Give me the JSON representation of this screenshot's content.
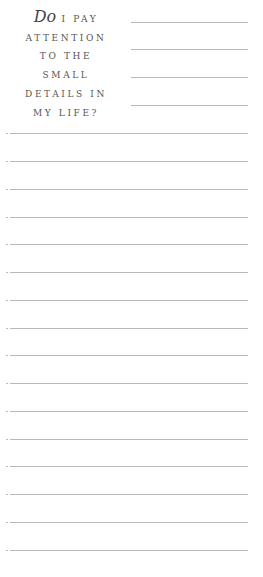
{
  "prompt": {
    "dropcap": "Do",
    "lines": [
      "I PAY",
      "ATTENTION",
      "TO THE",
      "SMALL",
      "DETAILS IN",
      "MY LIFE?"
    ]
  },
  "header_lines_y": [
    22,
    49,
    77,
    105
  ],
  "full_lines_y": [
    133,
    161,
    189,
    217,
    244,
    272,
    300,
    328,
    355,
    383,
    411,
    439,
    466,
    494,
    522,
    550
  ],
  "colors": {
    "line": "#b8b8b8",
    "text": "#555555"
  }
}
